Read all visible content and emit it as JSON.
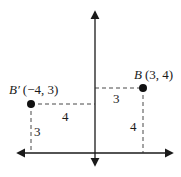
{
  "diagram": {
    "type": "coordinate-plane",
    "points": [
      {
        "id": "B",
        "name_italic": "B",
        "coords_text": "(3, 4)",
        "x": 3,
        "y": 4
      },
      {
        "id": "B_prime",
        "name_italic": "B′",
        "coords_text": "(−4, 3)",
        "x": -4,
        "y": 3
      }
    ],
    "distance_labels": {
      "b_horizontal": "3",
      "b_vertical": "4",
      "bprime_horizontal": "4",
      "bprime_vertical": "3"
    },
    "colors": {
      "axis": "#1a1a1a",
      "point": "#111111",
      "dashed": "#333333",
      "text": "#1a1a1a"
    }
  }
}
